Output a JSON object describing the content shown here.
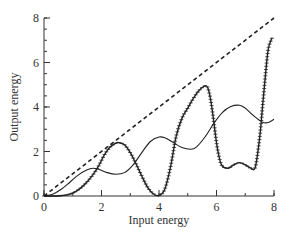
{
  "chart_data": {
    "type": "line",
    "title": "",
    "xlabel": "Input energy",
    "ylabel": "Output energy",
    "xlim": [
      0,
      8
    ],
    "ylim": [
      0,
      8
    ],
    "x_ticks": [
      0,
      2,
      4,
      6,
      8
    ],
    "y_ticks": [
      0,
      2,
      4,
      6,
      8
    ],
    "x_minor_step": 1,
    "y_minor_step": 0.5,
    "grid": false,
    "legend": null,
    "series": [
      {
        "name": "reference (y = x)",
        "style": "dashed",
        "color": "#222222",
        "x": [
          0,
          8
        ],
        "y": [
          0,
          8
        ]
      },
      {
        "name": "solid curve",
        "style": "solid",
        "color": "#222222",
        "x": [
          0,
          0.3,
          0.6,
          0.9,
          1.2,
          1.5,
          1.7,
          1.9,
          2.2,
          2.5,
          2.8,
          3.1,
          3.4,
          3.7,
          4.0,
          4.2,
          4.5,
          4.8,
          5.1,
          5.3,
          5.6,
          5.9,
          6.2,
          6.5,
          6.8,
          7.0,
          7.3,
          7.6,
          7.8,
          8.0
        ],
        "y": [
          0,
          0.08,
          0.3,
          0.62,
          0.95,
          1.18,
          1.25,
          1.2,
          1.05,
          0.98,
          1.05,
          1.4,
          1.95,
          2.45,
          2.65,
          2.62,
          2.4,
          2.18,
          2.1,
          2.2,
          2.65,
          3.25,
          3.75,
          4.02,
          4.08,
          3.95,
          3.6,
          3.32,
          3.3,
          3.45
        ]
      },
      {
        "name": "marked curve",
        "style": "solid-with-cross-markers",
        "color": "#222222",
        "x": [
          0,
          0.4,
          0.8,
          1.1,
          1.4,
          1.7,
          1.9,
          2.1,
          2.3,
          2.5,
          2.6,
          2.8,
          3.0,
          3.2,
          3.4,
          3.6,
          3.8,
          4.0,
          4.2,
          4.4,
          4.6,
          4.8,
          5.0,
          5.2,
          5.4,
          5.6,
          5.7,
          5.8,
          5.9,
          6.0,
          6.1,
          6.2,
          6.4,
          6.6,
          6.8,
          7.0,
          7.2,
          7.35,
          7.5,
          7.6,
          7.7,
          7.8,
          7.93
        ],
        "y": [
          0,
          0.0,
          0.05,
          0.2,
          0.5,
          0.95,
          1.35,
          1.85,
          2.2,
          2.38,
          2.4,
          2.3,
          1.95,
          1.45,
          0.9,
          0.4,
          0.1,
          0.02,
          0.3,
          1.3,
          2.7,
          3.5,
          3.95,
          4.4,
          4.75,
          4.95,
          4.85,
          4.3,
          3.4,
          2.4,
          1.7,
          1.35,
          1.25,
          1.4,
          1.5,
          1.4,
          1.25,
          1.3,
          2.6,
          4.0,
          5.4,
          6.6,
          7.1
        ]
      }
    ]
  },
  "plot_area_px": {
    "x0": 44,
    "x1": 274,
    "y0": 196,
    "y1": 18
  }
}
